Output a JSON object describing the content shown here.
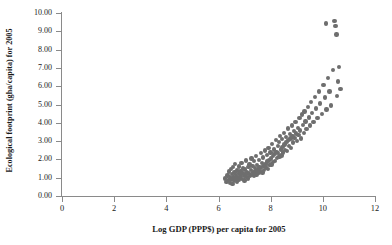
{
  "chart": {
    "type": "scatter",
    "title": "",
    "xlabel": "Log GDP (PPP$) per capita for 2005",
    "ylabel": "Ecological footprint (gha/capita) for 2005",
    "marker_color": "#6e6e6e",
    "axis_color": "#8a8a8a",
    "grid": false,
    "legend": null
  },
  "chart_data": {
    "type": "scatter",
    "title": "",
    "xlabel": "Log GDP (PPP$) per capita for 2005",
    "ylabel": "Ecological footprint (gha/capita) for 2005",
    "xlim": [
      0,
      12
    ],
    "ylim": [
      0,
      10
    ],
    "xticks": [
      0,
      2,
      4,
      6,
      8,
      10,
      12
    ],
    "xtick_labels": [
      "0",
      "2",
      "4",
      "6",
      "8",
      "10",
      "12"
    ],
    "yticks": [
      0,
      1,
      2,
      3,
      4,
      5,
      6,
      7,
      8,
      9,
      10
    ],
    "ytick_labels": [
      "0.00",
      "1.00",
      "2.00",
      "3.00",
      "4.00",
      "5.00",
      "6.00",
      "7.00",
      "8.00",
      "9.00",
      "10.00"
    ],
    "grid": false,
    "legend_position": "none",
    "marker_color": "#6e6e6e",
    "marker_size": 4.4,
    "n_points": 152,
    "points": [
      [
        6.26,
        0.95
      ],
      [
        6.31,
        0.76
      ],
      [
        6.34,
        1.12
      ],
      [
        6.38,
        0.88
      ],
      [
        6.4,
        1.33
      ],
      [
        6.43,
        0.72
      ],
      [
        6.45,
        1.05
      ],
      [
        6.47,
        1.48
      ],
      [
        6.49,
        0.9
      ],
      [
        6.52,
        1.2
      ],
      [
        6.54,
        0.66
      ],
      [
        6.56,
        1.6
      ],
      [
        6.58,
        1.02
      ],
      [
        6.6,
        0.84
      ],
      [
        6.62,
        1.28
      ],
      [
        6.64,
        1.75
      ],
      [
        6.66,
        0.95
      ],
      [
        6.68,
        1.15
      ],
      [
        6.7,
        0.78
      ],
      [
        6.72,
        1.4
      ],
      [
        6.74,
        1.05
      ],
      [
        6.76,
        0.88
      ],
      [
        6.78,
        1.62
      ],
      [
        6.8,
        1.22
      ],
      [
        6.82,
        0.97
      ],
      [
        6.84,
        1.35
      ],
      [
        6.86,
        1.08
      ],
      [
        6.88,
        1.8
      ],
      [
        6.9,
        0.92
      ],
      [
        6.92,
        1.25
      ],
      [
        6.95,
        1.5
      ],
      [
        6.97,
        1.1
      ],
      [
        6.99,
        0.85
      ],
      [
        7.02,
        1.45
      ],
      [
        7.04,
        1.18
      ],
      [
        7.06,
        1.95
      ],
      [
        7.08,
        1.05
      ],
      [
        7.1,
        1.32
      ],
      [
        7.12,
        0.95
      ],
      [
        7.15,
        1.58
      ],
      [
        7.17,
        1.22
      ],
      [
        7.19,
        1.72
      ],
      [
        7.21,
        1.08
      ],
      [
        7.24,
        1.42
      ],
      [
        7.26,
        2.05
      ],
      [
        7.28,
        1.15
      ],
      [
        7.3,
        1.65
      ],
      [
        7.33,
        1.28
      ],
      [
        7.35,
        1.9
      ],
      [
        7.37,
        1.12
      ],
      [
        7.39,
        1.52
      ],
      [
        7.42,
        1.35
      ],
      [
        7.44,
        2.2
      ],
      [
        7.46,
        1.18
      ],
      [
        7.48,
        1.7
      ],
      [
        7.51,
        1.45
      ],
      [
        7.53,
        1.25
      ],
      [
        7.55,
        1.98
      ],
      [
        7.57,
        1.6
      ],
      [
        7.6,
        1.38
      ],
      [
        7.62,
        2.35
      ],
      [
        7.64,
        1.52
      ],
      [
        7.66,
        1.82
      ],
      [
        7.69,
        1.28
      ],
      [
        7.71,
        2.1
      ],
      [
        7.73,
        1.65
      ],
      [
        7.75,
        1.42
      ],
      [
        7.78,
        2.48
      ],
      [
        7.8,
        1.75
      ],
      [
        7.82,
        1.55
      ],
      [
        7.85,
        2.25
      ],
      [
        7.87,
        1.88
      ],
      [
        7.89,
        1.48
      ],
      [
        7.92,
        2.62
      ],
      [
        7.94,
        1.95
      ],
      [
        7.96,
        1.68
      ],
      [
        7.99,
        2.38
      ],
      [
        8.01,
        2.05
      ],
      [
        8.03,
        1.72
      ],
      [
        8.06,
        2.85
      ],
      [
        8.08,
        2.18
      ],
      [
        8.1,
        1.85
      ],
      [
        8.13,
        2.55
      ],
      [
        8.15,
        2.28
      ],
      [
        8.17,
        1.92
      ],
      [
        8.2,
        3.05
      ],
      [
        8.22,
        2.42
      ],
      [
        8.24,
        2.08
      ],
      [
        8.27,
        2.72
      ],
      [
        8.29,
        2.35
      ],
      [
        8.32,
        2.95
      ],
      [
        8.34,
        2.15
      ],
      [
        8.36,
        3.28
      ],
      [
        8.39,
        2.55
      ],
      [
        8.41,
        2.22
      ],
      [
        8.44,
        3.1
      ],
      [
        8.46,
        2.68
      ],
      [
        8.48,
        2.38
      ],
      [
        8.51,
        3.45
      ],
      [
        8.53,
        2.82
      ],
      [
        8.56,
        2.52
      ],
      [
        8.58,
        3.22
      ],
      [
        8.61,
        2.95
      ],
      [
        8.63,
        2.45
      ],
      [
        8.66,
        3.68
      ],
      [
        8.68,
        3.05
      ],
      [
        8.71,
        2.72
      ],
      [
        8.73,
        3.38
      ],
      [
        8.76,
        3.15
      ],
      [
        8.78,
        2.62
      ],
      [
        8.81,
        3.85
      ],
      [
        8.84,
        3.28
      ],
      [
        8.86,
        2.92
      ],
      [
        8.89,
        3.55
      ],
      [
        8.92,
        3.18
      ],
      [
        8.95,
        4.05
      ],
      [
        8.98,
        3.42
      ],
      [
        9.01,
        3.02
      ],
      [
        9.04,
        3.72
      ],
      [
        9.07,
        3.35
      ],
      [
        9.1,
        4.25
      ],
      [
        9.13,
        3.58
      ],
      [
        9.16,
        3.15
      ],
      [
        9.2,
        4.45
      ],
      [
        9.23,
        3.88
      ],
      [
        9.27,
        3.45
      ],
      [
        9.3,
        4.62
      ],
      [
        9.34,
        4.08
      ],
      [
        9.38,
        3.65
      ],
      [
        9.42,
        4.88
      ],
      [
        9.46,
        4.28
      ],
      [
        9.5,
        3.85
      ],
      [
        9.55,
        5.15
      ],
      [
        9.59,
        4.52
      ],
      [
        9.64,
        4.05
      ],
      [
        9.69,
        5.42
      ],
      [
        9.74,
        4.78
      ],
      [
        9.79,
        4.25
      ],
      [
        9.85,
        5.72
      ],
      [
        9.9,
        5.05
      ],
      [
        9.96,
        4.48
      ],
      [
        10.02,
        6.05
      ],
      [
        10.08,
        5.38
      ],
      [
        10.14,
        4.72
      ],
      [
        10.2,
        6.45
      ],
      [
        10.26,
        5.72
      ],
      [
        10.32,
        4.95
      ],
      [
        10.38,
        6.88
      ],
      [
        10.44,
        9.55
      ],
      [
        10.48,
        9.28
      ],
      [
        10.52,
        8.82
      ],
      [
        10.55,
        5.45
      ],
      [
        10.58,
        6.25
      ],
      [
        10.62,
        7.05
      ],
      [
        10.68,
        5.85
      ],
      [
        10.12,
        9.42
      ]
    ]
  }
}
